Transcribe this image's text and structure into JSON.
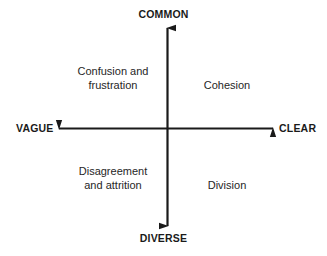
{
  "diagram": {
    "type": "two-by-two-matrix",
    "background_color": "#ffffff",
    "line_color": "#1a1a1a",
    "text_color": "#262626",
    "axes": {
      "vertical": {
        "top_label": "COMMON",
        "bottom_label": "DIVERSE"
      },
      "horizontal": {
        "left_label": "VAGUE",
        "right_label": "CLEAR"
      }
    },
    "quadrants": {
      "top_left": "Confusion and\nfrustration",
      "top_right": "Cohesion",
      "bottom_left": "Disagreement\nand attrition",
      "bottom_right": "Division"
    }
  }
}
